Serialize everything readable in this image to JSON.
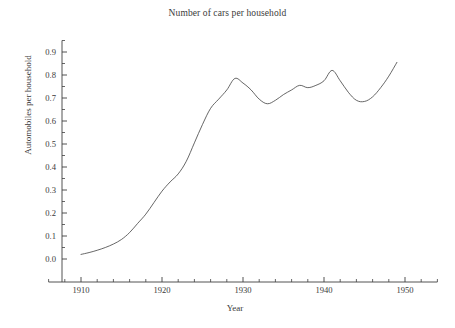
{
  "chart_data": {
    "type": "line",
    "title": "Number of cars per household",
    "xlabel": "Year",
    "ylabel": "Automobiles per household",
    "xlim": [
      1906,
      1954
    ],
    "ylim": [
      0.0,
      0.95
    ],
    "grid": false,
    "legend": null,
    "x_ticks": [
      "1910",
      "1920",
      "1930",
      "1940",
      "1950"
    ],
    "x_tick_values": [
      1910,
      1920,
      1930,
      1940,
      1950
    ],
    "x_minor_interval": 2,
    "y_ticks": [
      "0.0",
      "0.1",
      "0.2",
      "0.3",
      "0.4",
      "0.5",
      "0.6",
      "0.7",
      "0.8",
      "0.9"
    ],
    "y_tick_values": [
      0.0,
      0.1,
      0.2,
      0.3,
      0.4,
      0.5,
      0.6,
      0.7,
      0.8,
      0.9
    ],
    "y_minor_interval": 0.05,
    "line_color": "#404040",
    "line_width": 0.8,
    "series": [
      {
        "name": "Automobiles per household",
        "x": [
          1910,
          1911,
          1912,
          1913,
          1914,
          1915,
          1916,
          1917,
          1918,
          1919,
          1920,
          1921,
          1922,
          1923,
          1924,
          1925,
          1926,
          1927,
          1928,
          1929,
          1930,
          1931,
          1932,
          1933,
          1934,
          1935,
          1936,
          1937,
          1938,
          1939,
          1940,
          1941,
          1942,
          1943,
          1944,
          1945,
          1946,
          1947,
          1948,
          1949
        ],
        "y": [
          0.02,
          0.028,
          0.038,
          0.05,
          0.065,
          0.085,
          0.115,
          0.155,
          0.195,
          0.245,
          0.295,
          0.335,
          0.37,
          0.425,
          0.505,
          0.585,
          0.655,
          0.695,
          0.735,
          0.785,
          0.765,
          0.735,
          0.695,
          0.675,
          0.69,
          0.715,
          0.735,
          0.755,
          0.745,
          0.755,
          0.775,
          0.82,
          0.775,
          0.725,
          0.69,
          0.685,
          0.705,
          0.745,
          0.795,
          0.855
        ]
      }
    ]
  }
}
